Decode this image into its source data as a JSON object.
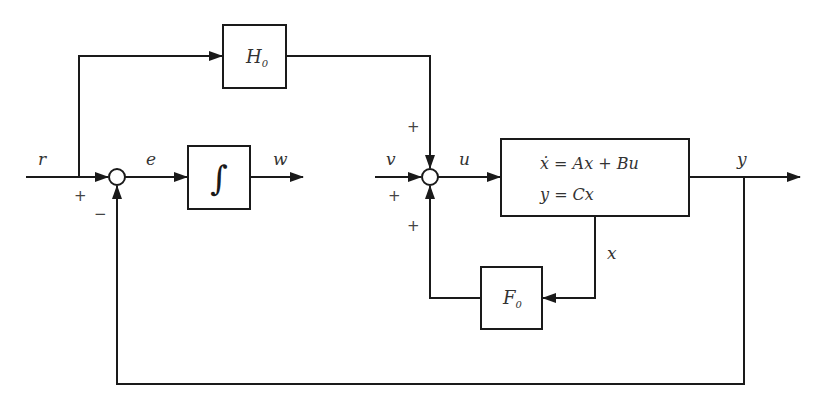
{
  "diagram": {
    "type": "block-diagram",
    "signals": {
      "r": "r",
      "e": "e",
      "w": "w",
      "v": "v",
      "u": "u",
      "y": "y",
      "x": "x"
    },
    "blocks": {
      "feedforward": {
        "name": "H",
        "subscript": "0"
      },
      "integrator": {
        "symbol": "∫"
      },
      "plant": {
        "line1": "ẋ = Ax + Bu",
        "line2": "y = Cx"
      },
      "state_feedback": {
        "name": "F",
        "subscript": "0"
      }
    },
    "summing_junctions": {
      "sum1": {
        "signs": {
          "left": "+",
          "bottom": "−"
        }
      },
      "sum2": {
        "signs": {
          "top": "+",
          "left": "+",
          "bottom": "+"
        }
      }
    },
    "edges": [
      {
        "from": "r",
        "to": "sum1",
        "sign": "+"
      },
      {
        "from": "r",
        "to": "H0"
      },
      {
        "from": "sum1",
        "to": "integrator",
        "label": "e"
      },
      {
        "from": "integrator",
        "to": "output",
        "label": "w"
      },
      {
        "from": "H0",
        "to": "sum2",
        "sign": "+"
      },
      {
        "from": "v",
        "to": "sum2",
        "sign": "+"
      },
      {
        "from": "F0",
        "to": "sum2",
        "sign": "+"
      },
      {
        "from": "sum2",
        "to": "plant",
        "label": "u"
      },
      {
        "from": "plant",
        "to": "output",
        "label": "y"
      },
      {
        "from": "plant",
        "to": "F0",
        "label": "x"
      },
      {
        "from": "y",
        "to": "sum1",
        "sign": "−"
      }
    ]
  }
}
